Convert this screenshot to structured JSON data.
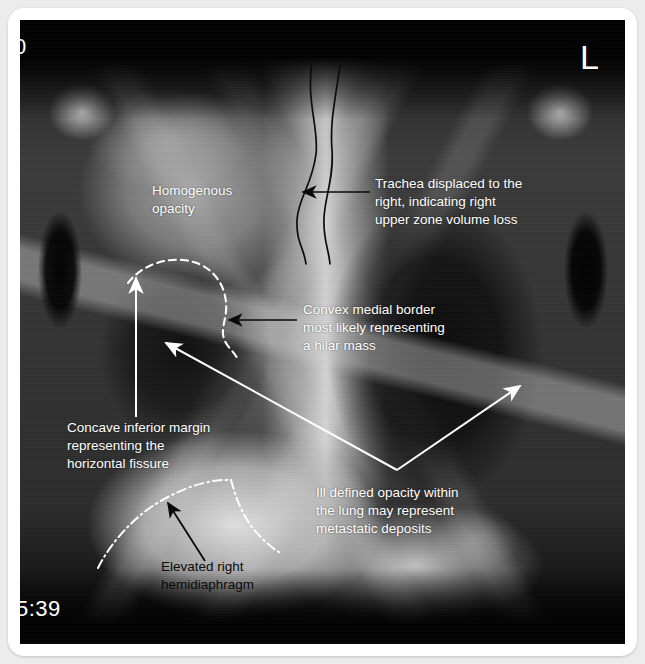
{
  "image": {
    "type": "chest-radiograph",
    "view": "PA erect chest X-ray",
    "frame_color": "#ffffff",
    "background_color": "#ececed"
  },
  "markers": {
    "side_marker": "L",
    "timestamp": "5:39",
    "corner_digit": "0"
  },
  "annotations": [
    {
      "id": "homogenous-opacity",
      "text": "Homogenous\nopacity",
      "color": "#ffffff",
      "pointer": "none"
    },
    {
      "id": "trachea-displaced",
      "text": "Trachea displaced to the\nright, indicating right\nupper zone volume loss",
      "color": "#ffffff",
      "pointer": "black-arrow-left"
    },
    {
      "id": "convex-medial-border",
      "text": "Convex medial border\nmost likely representing\na hilar mass",
      "color": "#ffffff",
      "pointer": "black-arrow-left"
    },
    {
      "id": "concave-inferior-margin",
      "text": "Concave inferior margin\nrepresenting the\nhorizontal fissure",
      "color": "#ffffff",
      "pointer": "white-arrow-up"
    },
    {
      "id": "ill-defined-opacity",
      "text": "Ill defined opacity within\nthe lung may represent\nmetastatic deposits",
      "color": "#ffffff",
      "pointer": "white-double-arrow"
    },
    {
      "id": "elevated-hemidiaphragm",
      "text": "Elevated right\nhemidiaphragm",
      "color": "#0a0a0a",
      "pointer": "black-arrow-upleft"
    }
  ],
  "overlay_graphics": [
    {
      "id": "trachea-outline-left",
      "style": "black-curve"
    },
    {
      "id": "trachea-outline-right",
      "style": "black-curve"
    },
    {
      "id": "hilar-mass-outline",
      "style": "white-dashed-arc"
    },
    {
      "id": "hemidiaphragm-outline",
      "style": "white-dash-dot-arc"
    }
  ]
}
